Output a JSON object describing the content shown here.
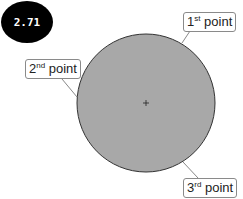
{
  "badge": {
    "value": "2.71"
  },
  "circle": {
    "center": [
      146,
      103
    ],
    "radius": 69,
    "fill": "#a8a8a8",
    "stroke": "#333333"
  },
  "labels": [
    {
      "number": "1",
      "suffix": "st",
      "word": "point"
    },
    {
      "number": "2",
      "suffix": "nd",
      "word": "point"
    },
    {
      "number": "3",
      "suffix": "rd",
      "word": "point"
    }
  ]
}
